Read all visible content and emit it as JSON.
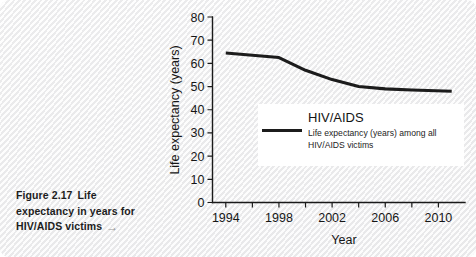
{
  "page": {
    "background_color": "#f4f4f4"
  },
  "caption": {
    "figure_label": "Figure 2.17",
    "line1_rest": "Life",
    "line2": "expectancy in years for",
    "line3": "HIV/AIDS victims",
    "arrow_icon": "arrow-right-icon",
    "arrow_glyph": "→",
    "arrow_color": "#9a9a9a"
  },
  "legend": {
    "title": "HIV/AIDS",
    "description_line1": "Life expectancy (years) among all",
    "description_line2": "HIV/AIDS victims",
    "swatch_color": "#1c1c1c",
    "background_color": "#ffffff"
  },
  "chart_data": {
    "type": "line",
    "title": "",
    "xlabel": "Year",
    "ylabel": "Life expectancy (years)",
    "xlim": [
      1993,
      2012
    ],
    "ylim": [
      0,
      80
    ],
    "grid": false,
    "legend_position": "inside-lower-right",
    "y_ticks": [
      0,
      10,
      20,
      30,
      40,
      50,
      60,
      70,
      80
    ],
    "y_tick_labels": [
      "0",
      "10",
      "20",
      "30",
      "40",
      "50",
      "60",
      "70",
      "80"
    ],
    "x_ticks": [
      1994,
      1996,
      1998,
      2000,
      2002,
      2004,
      2006,
      2008,
      2010
    ],
    "x_tick_labels": [
      "1994",
      "",
      "1998",
      "",
      "2002",
      "",
      "2006",
      "",
      "2010"
    ],
    "series": [
      {
        "name": "Life expectancy (years) among all HIV/AIDS victims",
        "color": "#1c1c1c",
        "x": [
          1994,
          1996,
          1998,
          2000,
          2002,
          2004,
          2006,
          2008,
          2011
        ],
        "values": [
          64.5,
          63.5,
          62.5,
          57.0,
          53.0,
          50.0,
          49.0,
          48.5,
          48.0
        ]
      }
    ]
  }
}
